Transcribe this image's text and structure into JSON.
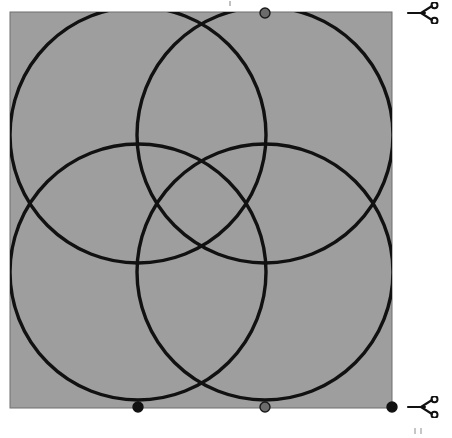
{
  "page": {
    "background_color": "#ffffff",
    "width": 452,
    "height": 438
  },
  "figure": {
    "name": "four-overlapping-circles",
    "panel": {
      "label": "gray-square-panel",
      "fill_color": "#9e9e9e",
      "border_color": "#6f6f6f",
      "border_width": 1,
      "x": 10,
      "y": 12,
      "width": 382,
      "height": 396
    },
    "circles": [
      {
        "label": "circle-top-left",
        "cx": 138,
        "cy": 135,
        "r": 128
      },
      {
        "label": "circle-top-right",
        "cx": 265,
        "cy": 135,
        "r": 128
      },
      {
        "label": "circle-bottom-left",
        "cx": 138,
        "cy": 272,
        "r": 128
      },
      {
        "label": "circle-bottom-right",
        "cx": 265,
        "cy": 272,
        "r": 128
      }
    ],
    "circle_stroke_color": "#111111",
    "circle_stroke_width": 3.4,
    "markers": [
      {
        "label": "marker-top-center",
        "cx": 265,
        "cy": 13,
        "r": 5.0,
        "fill": "#6b6b6b",
        "stroke": "#1a1a1a"
      },
      {
        "label": "marker-bottom-left",
        "cx": 138,
        "cy": 407,
        "r": 5.0,
        "fill": "#111111",
        "stroke": "#111111"
      },
      {
        "label": "marker-bottom-center",
        "cx": 265,
        "cy": 407,
        "r": 5.0,
        "fill": "#6b6b6b",
        "stroke": "#1a1a1a"
      },
      {
        "label": "marker-bottom-right-corner",
        "cx": 392,
        "cy": 407,
        "r": 5.0,
        "fill": "#111111",
        "stroke": "#111111"
      }
    ]
  },
  "cut_markers": {
    "top": {
      "icon": "scissors-icon",
      "label": ""
    },
    "bottom": {
      "icon": "scissors-icon",
      "label": ""
    }
  },
  "registration_marks": {
    "top_center": "tick-mark",
    "bottom_right_a": "tick-mark",
    "bottom_right_b": "tick-mark"
  }
}
